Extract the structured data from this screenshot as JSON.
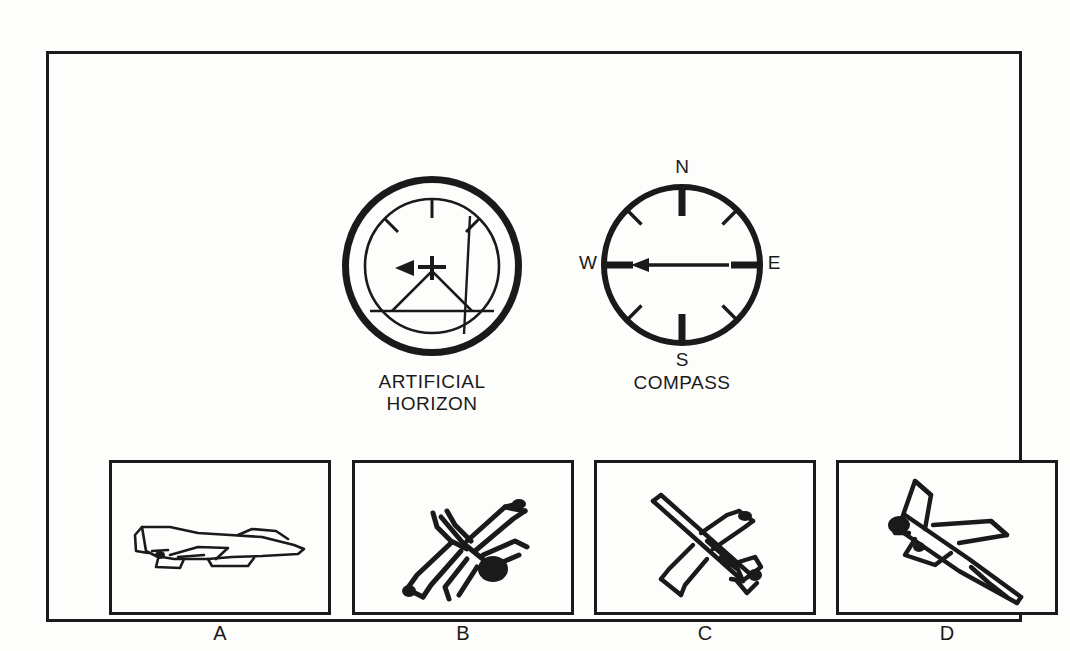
{
  "figure": {
    "type": "aviation-instrument-question",
    "background_color": "#fdfdfc",
    "ink_color": "#1a1a1a"
  },
  "instruments": [
    {
      "name": "artificial-horizon",
      "caption": "ARTIFICIAL\nHORIZON",
      "reading": {
        "bank_angle_deg": 0,
        "pitch": "level-to-slightly-nose-up",
        "pointer_direction": "left",
        "bank_ticks_deg": [
          -45,
          0,
          45
        ]
      }
    },
    {
      "name": "compass",
      "caption": "COMPASS",
      "cardinals": {
        "north": "N",
        "east": "E",
        "south": "S",
        "west": "W"
      },
      "reading": {
        "heading": "W",
        "heading_deg": 270,
        "needle_direction": "west",
        "cardinal_tick_count": 4,
        "intercardinal_tick_count": 4
      }
    }
  ],
  "answers": [
    {
      "label": "A",
      "name": "answer-panel-a",
      "aircraft": "fighter-jet",
      "view": "side-profile",
      "attitude": "level flight, nose right"
    },
    {
      "label": "B",
      "name": "answer-panel-b",
      "aircraft": "fighter-jet",
      "view": "rear-three-quarter",
      "attitude": "banked, descending toward lower-left"
    },
    {
      "label": "C",
      "name": "answer-panel-c",
      "aircraft": "fighter-jet",
      "view": "rear-three-quarter",
      "attitude": "climbing toward upper-left"
    },
    {
      "label": "D",
      "name": "answer-panel-d",
      "aircraft": "fighter-jet",
      "view": "front-three-quarter",
      "attitude": "diving toward lower-right"
    }
  ]
}
